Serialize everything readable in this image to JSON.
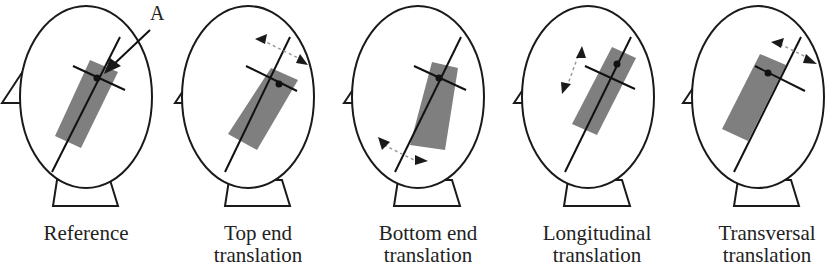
{
  "figure": {
    "annotation_label": "A",
    "panels": [
      {
        "id": "reference",
        "caption_line1": "Reference",
        "caption_line2": ""
      },
      {
        "id": "top-end",
        "caption_line1": "Top end",
        "caption_line2": "translation"
      },
      {
        "id": "bottom-end",
        "caption_line1": "Bottom end",
        "caption_line2": "translation"
      },
      {
        "id": "longitudinal",
        "caption_line1": "Longitudinal",
        "caption_line2": "translation"
      },
      {
        "id": "transversal",
        "caption_line1": "Transversal",
        "caption_line2": "translation"
      }
    ],
    "colors": {
      "outline": "#1a1a1a",
      "rectangle": "#7f7f7f",
      "dashed_arrow": "#9a9a9a",
      "text": "#222222"
    }
  }
}
